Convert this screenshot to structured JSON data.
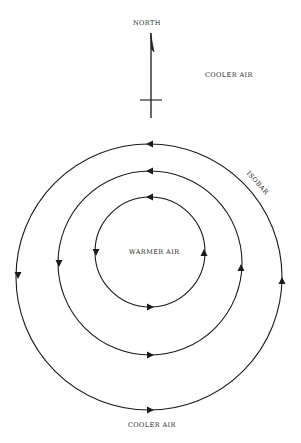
{
  "diagram": {
    "north_label": "NORTH",
    "top_label": "COOLER AIR",
    "center_label": "WARMER AIR",
    "bottom_label": "COOLER AIR",
    "isobar_label": "ISOBAR",
    "line_color": "#1a1a1a",
    "text_color": "#2a2a2a",
    "isobars": [
      {
        "name": "inner",
        "cx": 150,
        "cy": 252,
        "r": 55
      },
      {
        "name": "middle",
        "cx": 150,
        "cy": 263,
        "r": 92
      },
      {
        "name": "outer",
        "cx": 149,
        "cy": 277,
        "r": 133
      }
    ],
    "flow_direction": "counterclockwise"
  }
}
